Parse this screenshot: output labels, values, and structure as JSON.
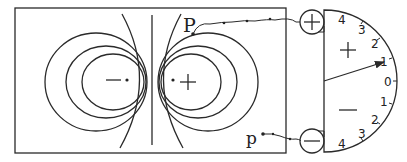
{
  "diagram": {
    "type": "equipotential-mapping-apparatus",
    "electrodes": {
      "negative": {
        "symbol": "−"
      },
      "positive": {
        "symbol": "+"
      }
    },
    "probes": {
      "upper": {
        "label": "P"
      },
      "lower": {
        "label": "p"
      }
    },
    "terminals": {
      "top": {
        "symbol": "+"
      },
      "bottom": {
        "symbol": "−"
      }
    },
    "galvanometer": {
      "upper_region_sign": "+",
      "lower_region_sign": "−",
      "scale_ticks": [
        "4",
        "3",
        "2",
        "1",
        "0",
        "1",
        "2",
        "3",
        "4"
      ],
      "needle_reading": "+1"
    }
  }
}
